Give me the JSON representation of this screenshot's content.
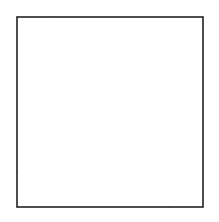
{
  "figure": {
    "kind": "geometric-line-diagram",
    "canvas": {
      "width": 219,
      "height": 222,
      "background_color": "#ffffff"
    },
    "frame": {
      "name": "outer-square-border",
      "x": 17,
      "y": 17,
      "width": 186,
      "height": 190,
      "stroke_color": "#222222",
      "stroke_width": 1.6,
      "fill_color": "#ffffff"
    },
    "spiral": {
      "description": "Each successive quadrilateral is inscribed in the previous one by taking a point a constant fraction t along every edge, producing an inward rotating spiral of squares.",
      "iterations": 8,
      "step_fraction": 0.18,
      "rotation_direction": "counterclockwise",
      "stroke_color": "#3a3a3a",
      "stroke_width": 0.9,
      "start_corners": [
        [
          17,
          17
        ],
        [
          203,
          17
        ],
        [
          203,
          207
        ],
        [
          17,
          207
        ]
      ],
      "levels": [
        {
          "index": 0,
          "label": "ring-0",
          "points": [
            [
              17,
              17
            ],
            [
              203,
              17
            ],
            [
              203,
              207
            ],
            [
              17,
              207
            ]
          ]
        },
        {
          "index": 1,
          "label": "ring-1",
          "points": [
            [
              50.5,
              17
            ],
            [
              203,
              51.2
            ],
            [
              169.5,
              207
            ],
            [
              17,
              172.8
            ]
          ]
        },
        {
          "index": 2,
          "label": "ring-2",
          "points": [
            [
              78.0,
              23.2
            ],
            [
              196.8,
              81.2
            ],
            [
              142.0,
              200.8
            ],
            [
              23.2,
              142.8
            ]
          ]
        },
        {
          "index": 3,
          "label": "ring-3",
          "points": [
            [
              99.4,
              33.6
            ],
            [
              185.6,
              104.4
            ],
            [
              120.6,
              190.4
            ],
            [
              34.4,
              119.6
            ]
          ]
        },
        {
          "index": 4,
          "label": "ring-4",
          "points": [
            [
              114.9,
              46.3
            ],
            [
              172.1,
              120.5
            ],
            [
              105.1,
              177.7
            ],
            [
              47.9,
              103.5
            ]
          ]
        },
        {
          "index": 5,
          "label": "ring-5",
          "points": [
            [
              125.2,
              59.7
            ],
            [
              158.5,
              130.7
            ],
            [
              94.8,
              164.3
            ],
            [
              61.5,
              93.3
            ]
          ]
        },
        {
          "index": 6,
          "label": "ring-6",
          "points": [
            [
              131.2,
              72.5
            ],
            [
              146.2,
              135.5
            ],
            [
              88.8,
              151.5
            ],
            [
              73.8,
              88.5
            ]
          ]
        },
        {
          "index": 7,
          "label": "ring-7",
          "points": [
            [
              133.9,
              83.8
            ],
            [
              136.8,
              135.4
            ],
            [
              86.1,
              140.2
            ],
            [
              83.2,
              88.6
            ]
          ]
        },
        {
          "index": 8,
          "label": "ring-8-innermost",
          "points": [
            [
              134.4,
              93.1
            ],
            [
              129.8,
              132.0
            ],
            [
              85.6,
              130.9
            ],
            [
              90.2,
              92.0
            ]
          ]
        }
      ]
    }
  }
}
